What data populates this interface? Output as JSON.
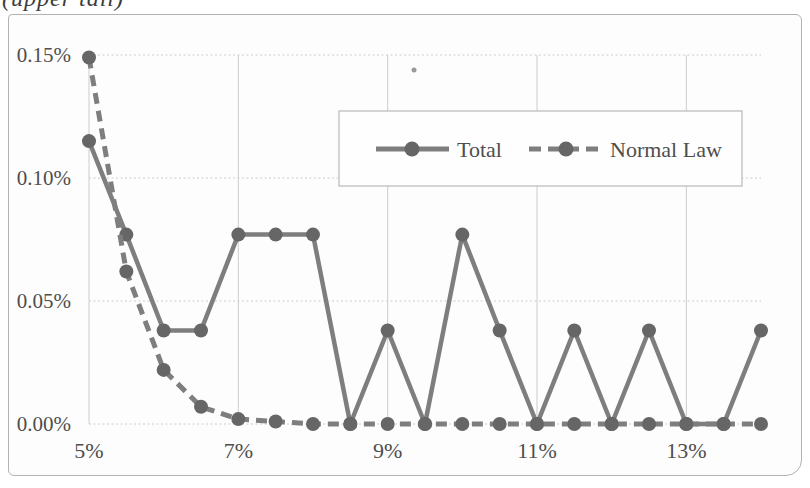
{
  "annotation": {
    "top_left": "(upper tail)"
  },
  "colors": {
    "background": "#fdfdfd",
    "chart_border": "#b2b2b2",
    "grid": "#cccccc",
    "line": "#7e7e7e",
    "marker": "#666666",
    "text": "#4e4e4e",
    "legend_border": "#b8b8b8",
    "legend_fill": "#fefefe",
    "speck": "#8a8a8a"
  },
  "chart_data": {
    "type": "line",
    "title": "",
    "xlabel": "",
    "ylabel": "",
    "x_unit": "%",
    "y_unit": "%",
    "x": [
      5,
      5.5,
      6,
      6.5,
      7,
      7.5,
      8,
      8.5,
      9,
      9.5,
      10,
      10.5,
      11,
      11.5,
      12,
      12.5,
      13,
      13.5,
      14
    ],
    "series": [
      {
        "name": "Total",
        "line_style": "solid",
        "values": [
          0.115,
          0.077,
          0.038,
          0.038,
          0.077,
          0.077,
          0.077,
          0.0,
          0.038,
          0.0,
          0.077,
          0.038,
          0.0,
          0.038,
          0.0,
          0.038,
          0.0,
          0.0,
          0.038
        ]
      },
      {
        "name": "Normal Law",
        "line_style": "dashed",
        "values": [
          0.149,
          0.062,
          0.022,
          0.007,
          0.002,
          0.001,
          0.0,
          0.0,
          0.0,
          0.0,
          0.0,
          0.0,
          0.0,
          0.0,
          0.0,
          0.0,
          0.0,
          0.0,
          0.0
        ]
      }
    ],
    "x_ticks": {
      "values": [
        5,
        7,
        9,
        11,
        13
      ],
      "labels": [
        "5%",
        "7%",
        "9%",
        "11%",
        "13%"
      ]
    },
    "y_ticks": {
      "values": [
        0,
        0.05,
        0.1,
        0.15
      ],
      "labels": [
        "0.00%",
        "0.05%",
        "0.10%",
        "0.15%"
      ]
    },
    "xlim": [
      5,
      14
    ],
    "ylim": [
      0,
      0.15
    ],
    "grid": true,
    "legend": {
      "position": "inside-top-center",
      "border": true,
      "items": [
        "Total",
        "Normal Law"
      ]
    }
  }
}
